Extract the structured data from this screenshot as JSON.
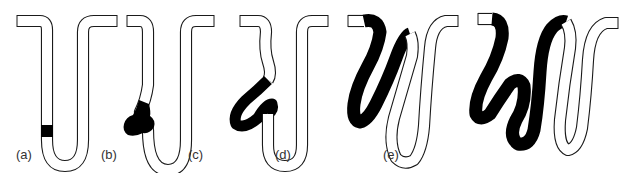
{
  "figure": {
    "panels": [
      {
        "id": "a",
        "label": "(a)",
        "stage": "small black band in left descending arm"
      },
      {
        "id": "b",
        "label": "(b)",
        "stage": "black blob bulging out near bottom of left arm"
      },
      {
        "id": "c",
        "label": "(c)",
        "stage": "black section forms a loop on left side"
      },
      {
        "id": "d",
        "label": "(d)",
        "stage": "black section forms a large S-shaped fold"
      },
      {
        "id": "e",
        "label": "(e)",
        "stage": "black section forms a double fold occupying most of left side"
      }
    ],
    "colors": {
      "ink": "#000000",
      "outline": "#1a1a1a",
      "tube": "#ffffff",
      "label": "#333333"
    }
  }
}
